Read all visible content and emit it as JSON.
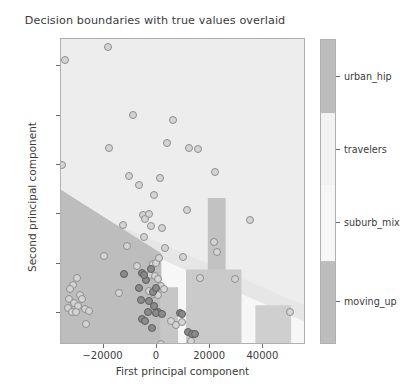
{
  "chart_data": {
    "type": "scatter",
    "title": "Decision boundaries with true values overlaid",
    "xlabel": "First principal component",
    "ylabel": "Second principal component",
    "xlim": [
      -36000,
      56000
    ],
    "ylim": [
      -16.5,
      45.5
    ],
    "xticks": [
      -20000,
      0,
      20000,
      40000
    ],
    "xticklabels": [
      "−20000",
      "0",
      "20000",
      "40000"
    ],
    "yticks": [
      -10,
      0,
      10,
      20,
      30,
      40
    ],
    "yticklabels": [
      "−10",
      "0",
      "10",
      "20",
      "30",
      "40"
    ],
    "grid": false,
    "legend_position": "right-colorbar",
    "colorbar": {
      "categories": [
        "moving_up",
        "suburb_mix",
        "travelers",
        "urban_hip"
      ],
      "tick_labels_top_to_bottom": [
        "urban_hip",
        "travelers",
        "suburb_mix",
        "moving_up"
      ],
      "colors_top_to_bottom": [
        "#bdbdbd",
        "#f2f2f2",
        "#f7f7f7",
        "#bdbdbd"
      ],
      "segment_bounds_pct_top_to_bottom": [
        [
          0,
          24
        ],
        [
          24,
          48
        ],
        [
          48,
          73
        ],
        [
          73,
          100
        ]
      ],
      "tick_positions_pct": [
        12,
        36,
        60,
        86
      ]
    },
    "region_colors": {
      "moving_up": "#bdbdbd",
      "travelers": "#ededed",
      "suburb_mix": "#f7f7f7",
      "urban_hip": "#bdbdbd"
    },
    "point_colors": {
      "open_fill": "#d4d4d4",
      "open_edge": "#8e8e8e",
      "dark_fill": "#8a8a8a",
      "dark_edge": "#5d5d5d"
    },
    "series": [
      {
        "name": "light_points",
        "marker": "open-circle",
        "points": [
          [
            -34500,
            41.2
          ],
          [
            -18200,
            43.9
          ],
          [
            -35800,
            19.9
          ],
          [
            -17800,
            23.4
          ],
          [
            -9100,
            30.2
          ],
          [
            6000,
            29.1
          ],
          [
            3800,
            24.4
          ],
          [
            12200,
            23.5
          ],
          [
            15400,
            23.2
          ],
          [
            -10400,
            17.7
          ],
          [
            -6800,
            15.9
          ],
          [
            1100,
            17.4
          ],
          [
            22000,
            18.5
          ],
          [
            -1200,
            13.9
          ],
          [
            11500,
            10.9
          ],
          [
            -12700,
            7.8
          ],
          [
            -5200,
            9.9
          ],
          [
            -4600,
            9.1
          ],
          [
            -3100,
            10.1
          ],
          [
            -2200,
            7.7
          ],
          [
            1900,
            7.3
          ],
          [
            35000,
            8.8
          ],
          [
            -11400,
            3.6
          ],
          [
            -4900,
            5.3
          ],
          [
            3000,
            3.2
          ],
          [
            21500,
            4.4
          ],
          [
            22500,
            2.3
          ],
          [
            -19900,
            1.6
          ],
          [
            -7300,
            -0.5
          ],
          [
            -1400,
            -0.1
          ],
          [
            -300,
            0.1
          ],
          [
            700,
            1.2
          ],
          [
            -2600,
            -2.3
          ],
          [
            -800,
            -2.6
          ],
          [
            500,
            -3.1
          ],
          [
            9900,
            1.3
          ],
          [
            16200,
            -3.0
          ],
          [
            29500,
            -3.1
          ],
          [
            -14300,
            -5.9
          ],
          [
            -2900,
            -5.6
          ],
          [
            -1100,
            -6.2
          ],
          [
            300,
            -6.4
          ],
          [
            1700,
            -4.5
          ],
          [
            2500,
            -5.2
          ],
          [
            -600,
            -9.9
          ],
          [
            5400,
            -11.6
          ],
          [
            7100,
            -12.4
          ],
          [
            9600,
            -11.9
          ],
          [
            1400,
            -16.3
          ],
          [
            13000,
            -15.6
          ],
          [
            -2000,
            -17.2
          ],
          [
            50000,
            -9.9
          ],
          [
            -30000,
            -2.9
          ],
          [
            -31500,
            -4.3
          ],
          [
            -32500,
            -5.1
          ],
          [
            -29000,
            -6.4
          ],
          [
            -33000,
            -7.2
          ],
          [
            -31000,
            -8.0
          ],
          [
            -29500,
            -8.6
          ],
          [
            -27000,
            -9.3
          ],
          [
            -25500,
            -9.6
          ],
          [
            -26500,
            -12.2
          ],
          [
            -33500,
            -9.1
          ],
          [
            -32000,
            -9.8
          ],
          [
            -28000,
            -7.1
          ],
          [
            -30500,
            -9.9
          ]
        ]
      },
      {
        "name": "dark_points",
        "marker": "filled-circle",
        "points": [
          [
            -12400,
            -2.1
          ],
          [
            -5600,
            -2.0
          ],
          [
            -3900,
            -3.3
          ],
          [
            -2100,
            -1.0
          ],
          [
            -1500,
            -5.8
          ],
          [
            -2800,
            -7.5
          ],
          [
            -400,
            -5.0
          ],
          [
            -900,
            -8.6
          ],
          [
            400,
            -9.9
          ],
          [
            -5400,
            -11.2
          ],
          [
            -4600,
            -11.7
          ],
          [
            -300,
            -10.0
          ],
          [
            2000,
            -10.2
          ],
          [
            8800,
            -10.1
          ],
          [
            9400,
            -10.3
          ],
          [
            11600,
            -13.9
          ],
          [
            13300,
            -14.3
          ],
          [
            14300,
            -14.2
          ],
          [
            -4900,
            -2.4
          ],
          [
            -6100,
            -7.3
          ],
          [
            -3400,
            -9.9
          ],
          [
            -1900,
            -13.1
          ],
          [
            -6700,
            -4.9
          ]
        ]
      }
    ]
  },
  "axes_frame": {
    "background": "#eeeeee",
    "border_color": "#b0b0b0"
  }
}
